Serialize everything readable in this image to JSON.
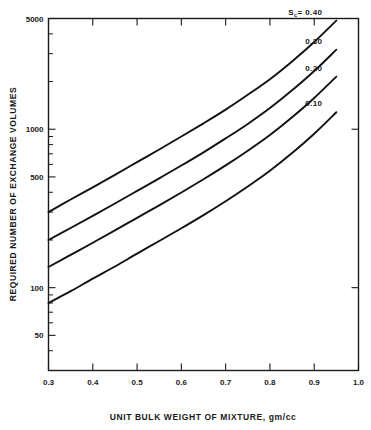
{
  "chart_data": {
    "type": "line",
    "title": "",
    "xlabel": "UNIT BULK WEIGHT OF MIXTURE, gm/cc",
    "ylabel": "REQUIRED NUMBER OF EXCHANGE VOLUMES",
    "xscale": "linear",
    "yscale": "log",
    "xlim": [
      0.3,
      1.0
    ],
    "ylim": [
      30,
      5000
    ],
    "grid": false,
    "legend_position": "inline-right",
    "xticks": [
      0.3,
      0.4,
      0.5,
      0.6,
      0.7,
      0.8,
      0.9,
      1.0
    ],
    "xtick_labels": [
      "0.3",
      "0.4",
      "0.5",
      "0.6",
      "0.7",
      "0.8",
      "0.9",
      "1.0"
    ],
    "yticks": [
      50,
      100,
      500,
      1000,
      5000
    ],
    "ytick_labels": [
      "50",
      "100",
      "500",
      "1000",
      "5000"
    ],
    "ytick_minor": [
      40,
      60,
      70,
      80,
      90,
      200,
      300,
      400,
      600,
      700,
      800,
      900,
      2000,
      3000,
      4000
    ],
    "series_param_symbol": "Sc",
    "series_param_prefix": "Sc =",
    "series": [
      {
        "name": "0.40",
        "label": "0.40",
        "x": [
          0.3,
          0.35,
          0.4,
          0.45,
          0.5,
          0.55,
          0.6,
          0.65,
          0.7,
          0.75,
          0.8,
          0.85,
          0.9,
          0.95
        ],
        "y": [
          300,
          360,
          430,
          515,
          620,
          745,
          900,
          1090,
          1330,
          1650,
          2070,
          2680,
          3550,
          4850
        ]
      },
      {
        "name": "0.30",
        "label": "0.30",
        "x": [
          0.3,
          0.35,
          0.4,
          0.45,
          0.5,
          0.55,
          0.6,
          0.65,
          0.7,
          0.75,
          0.8,
          0.85,
          0.9,
          0.95
        ],
        "y": [
          200,
          238,
          284,
          340,
          408,
          490,
          590,
          715,
          875,
          1080,
          1360,
          1760,
          2330,
          3180
        ]
      },
      {
        "name": "0.20",
        "label": "0.20",
        "x": [
          0.3,
          0.35,
          0.4,
          0.45,
          0.5,
          0.55,
          0.6,
          0.65,
          0.7,
          0.75,
          0.8,
          0.85,
          0.9,
          0.95
        ],
        "y": [
          135,
          161,
          192,
          230,
          276,
          331,
          399,
          483,
          591,
          732,
          920,
          1190,
          1575,
          2150
        ]
      },
      {
        "name": "0.10",
        "label": "0.10",
        "x": [
          0.3,
          0.35,
          0.4,
          0.45,
          0.5,
          0.55,
          0.6,
          0.65,
          0.7,
          0.75,
          0.8,
          0.85,
          0.9,
          0.95
        ],
        "y": [
          80,
          95,
          114,
          136,
          164,
          197,
          237,
          287,
          351,
          435,
          547,
          707,
          936,
          1280
        ]
      }
    ],
    "annotations": [
      {
        "text": "Sc = 0.40",
        "series": "0.40"
      },
      {
        "text": "0.30",
        "series": "0.30"
      },
      {
        "text": "0.20",
        "series": "0.20"
      },
      {
        "text": "0.10",
        "series": "0.10"
      }
    ]
  }
}
